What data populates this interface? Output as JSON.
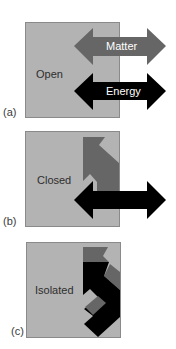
{
  "figure": {
    "colors": {
      "box_fill": "#b3b3b3",
      "box_stroke": "#8a8a8a",
      "matter_arrow": "#666666",
      "energy_arrow": "#000000",
      "background": "#ffffff"
    },
    "panels": [
      {
        "id": "a",
        "marker": "(a)",
        "system_label": "Open",
        "arrows": [
          {
            "label": "Matter",
            "type": "matter",
            "direction": "bidirectional",
            "crosses_boundary": true
          },
          {
            "label": "Energy",
            "type": "energy",
            "direction": "bidirectional",
            "crosses_boundary": true
          }
        ]
      },
      {
        "id": "b",
        "marker": "(b)",
        "system_label": "Closed",
        "arrows": [
          {
            "label": "",
            "type": "matter",
            "direction": "bent-inside",
            "crosses_boundary": false
          },
          {
            "label": "",
            "type": "energy",
            "direction": "bidirectional",
            "crosses_boundary": true
          }
        ]
      },
      {
        "id": "c",
        "marker": "(c)",
        "system_label": "Isolated",
        "arrows": [
          {
            "label": "",
            "type": "matter",
            "direction": "bent-inside",
            "crosses_boundary": false
          },
          {
            "label": "",
            "type": "energy",
            "direction": "bent-inside",
            "crosses_boundary": false
          }
        ]
      }
    ]
  }
}
